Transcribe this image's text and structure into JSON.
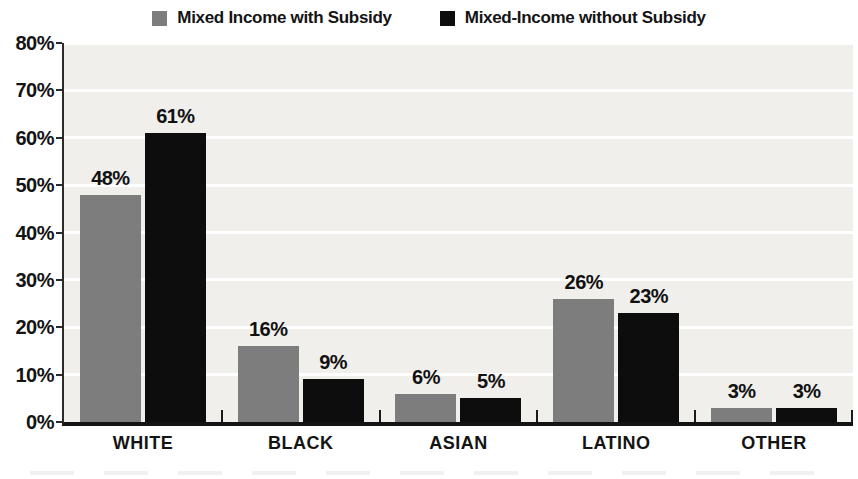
{
  "chart_data": {
    "type": "bar",
    "title": "",
    "categories": [
      "WHITE",
      "BLACK",
      "ASIAN",
      "LATINO",
      "OTHER"
    ],
    "series": [
      {
        "name": "Mixed Income with Subsidy",
        "color": "#7d7d7d",
        "values": [
          48,
          16,
          6,
          26,
          3
        ]
      },
      {
        "name": "Mixed-Income without Subsidy",
        "color": "#0d0d0d",
        "values": [
          61,
          9,
          5,
          23,
          3
        ]
      }
    ],
    "value_suffix": "%",
    "y_tick_labels": [
      "80%",
      "70%",
      "60%",
      "50%",
      "40%",
      "30%",
      "20%",
      "10%",
      "0%"
    ],
    "ylim": [
      0,
      80
    ],
    "ytick_step": 10,
    "grid": "horizontal",
    "legend_position": "top",
    "plot_background": "#f0efec",
    "gridline_color": "#ffffff",
    "axis_color": "#141414"
  }
}
